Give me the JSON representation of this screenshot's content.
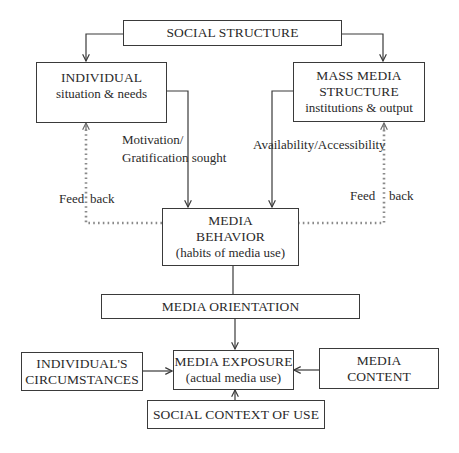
{
  "diagram": {
    "type": "flowchart",
    "nodes": {
      "social_structure": {
        "title": "SOCIAL STRUCTURE"
      },
      "individual": {
        "title": "INDIVIDUAL",
        "subtitle": "situation & needs"
      },
      "mass_media": {
        "title_line1": "MASS MEDIA",
        "title_line2": "STRUCTURE",
        "subtitle": "institutions & output"
      },
      "media_behavior": {
        "title_line1": "MEDIA",
        "title_line2": "BEHAVIOR",
        "subtitle": "(habits of media use)"
      },
      "media_orientation": {
        "title": "MEDIA ORIENTATION"
      },
      "media_exposure": {
        "title": "MEDIA EXPOSURE",
        "subtitle": "(actual media use)"
      },
      "individuals_circumstances": {
        "title_line1": "INDIVIDUAL'S",
        "title_line2": "CIRCUMSTANCES"
      },
      "media_content": {
        "title_line1": "MEDIA",
        "title_line2": "CONTENT"
      },
      "social_context": {
        "title": "SOCIAL CONTEXT OF USE"
      }
    },
    "edge_labels": {
      "motivation_line1": "Motivation/",
      "motivation_line2": "Gratification sought",
      "availability": "Availability/Accessibility",
      "feedback_left_a": "Feed",
      "feedback_left_b": "back",
      "feedback_right_a": "Feed",
      "feedback_right_b": "back"
    },
    "edges": [
      {
        "from": "social_structure",
        "to": "individual",
        "style": "solid-arrow"
      },
      {
        "from": "social_structure",
        "to": "mass_media",
        "style": "solid-arrow"
      },
      {
        "from": "individual",
        "to": "media_behavior",
        "label": "Motivation/ Gratification sought",
        "style": "solid-arrow"
      },
      {
        "from": "mass_media",
        "to": "media_behavior",
        "label": "Availability/Accessibility",
        "style": "solid-arrow"
      },
      {
        "from": "media_behavior",
        "to": "individual",
        "label": "Feed back",
        "style": "asterisk-dotted-arrow"
      },
      {
        "from": "media_behavior",
        "to": "mass_media",
        "label": "Feed back",
        "style": "asterisk-dotted-arrow"
      },
      {
        "from": "media_behavior",
        "to": "media_orientation",
        "style": "solid-line"
      },
      {
        "from": "media_orientation",
        "to": "media_exposure",
        "style": "solid-arrow"
      },
      {
        "from": "individuals_circumstances",
        "to": "media_exposure",
        "style": "solid-arrow"
      },
      {
        "from": "media_content",
        "to": "media_exposure",
        "style": "solid-arrow"
      },
      {
        "from": "social_context",
        "to": "media_exposure",
        "style": "solid-arrow"
      }
    ],
    "colors": {
      "line": "#3a3a3a",
      "feedback": "#8a8a8a",
      "text": "#2a2a2a",
      "background": "#ffffff"
    }
  }
}
